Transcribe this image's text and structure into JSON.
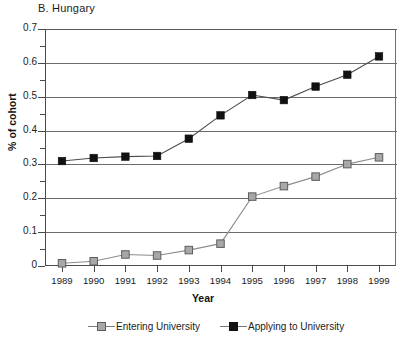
{
  "chart_data": {
    "type": "line",
    "title": "B.  Hungary",
    "xlabel": "Year",
    "ylabel": "% of cohort",
    "categories": [
      "1989",
      "1990",
      "1991",
      "1992",
      "1993",
      "1994",
      "1995",
      "1996",
      "1997",
      "1998",
      "1999"
    ],
    "x": [
      1989,
      1990,
      1991,
      1992,
      1993,
      1994,
      1995,
      1996,
      1997,
      1998,
      1999
    ],
    "ylim": [
      0,
      0.7
    ],
    "xlim": [
      1989,
      1999
    ],
    "yticks": [
      "0",
      "0.1",
      "0.2",
      "0.3",
      "0.4",
      "0.5",
      "0.6",
      "0.7"
    ],
    "ytick_values": [
      0,
      0.1,
      0.2,
      0.3,
      0.4,
      0.5,
      0.6,
      0.7
    ],
    "yminor_values": [
      0.05,
      0.15,
      0.25,
      0.35,
      0.45,
      0.55,
      0.65
    ],
    "grid": "horizontal",
    "legend_position": "bottom",
    "series": [
      {
        "name": "Entering University",
        "marker": "square",
        "color": "#a8a8a8",
        "values": [
          0.008,
          0.014,
          0.034,
          0.031,
          0.047,
          0.066,
          0.205,
          0.236,
          0.264,
          0.301,
          0.321
        ]
      },
      {
        "name": "Applying to University",
        "marker": "square",
        "color": "#111111",
        "values": [
          0.31,
          0.319,
          0.323,
          0.325,
          0.376,
          0.445,
          0.505,
          0.49,
          0.53,
          0.565,
          0.619
        ]
      }
    ]
  },
  "legend": {
    "items": [
      {
        "label": "Entering University",
        "swatch": "gray-square-marker"
      },
      {
        "label": "Applying to University",
        "swatch": "black-square-marker"
      }
    ]
  }
}
